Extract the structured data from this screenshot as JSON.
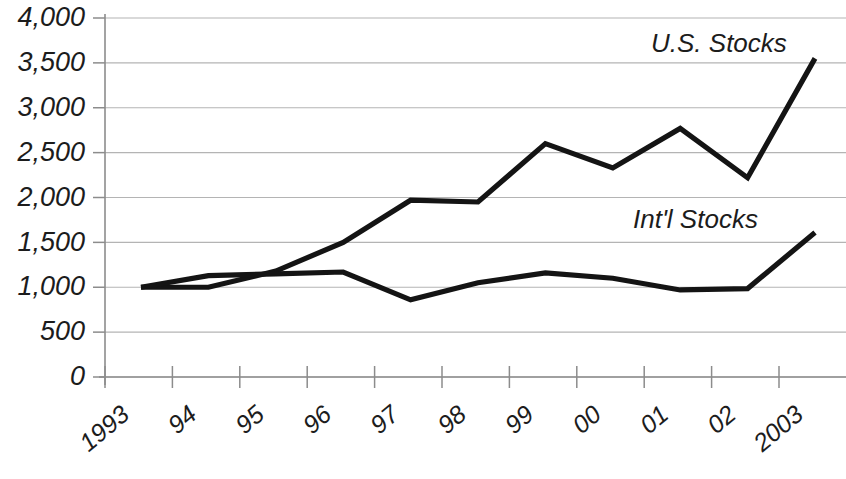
{
  "chart_data": {
    "type": "line",
    "title": "",
    "subtitle": "",
    "xlabel": "",
    "ylabel": "",
    "categories": [
      "1993",
      "94",
      "95",
      "96",
      "97",
      "98",
      "99",
      "00",
      "01",
      "02",
      "2003"
    ],
    "x_tick_labels": [
      "1993",
      "94",
      "95",
      "96",
      "97",
      "98",
      "99",
      "00",
      "01",
      "02",
      "2003"
    ],
    "y_tick_labels": [
      "4,000",
      "3,500",
      "3,000",
      "2,500",
      "2,000",
      "1,500",
      "1,000",
      "500",
      "0"
    ],
    "y_tick_values": [
      4000,
      3500,
      3000,
      2500,
      2000,
      1500,
      1000,
      500,
      0
    ],
    "ylim": [
      0,
      4000
    ],
    "grid": true,
    "grid_axis": "y",
    "legend_position": "inline-annotation",
    "series": [
      {
        "name": "U.S. Stocks",
        "color": "#141414",
        "values": [
          1000,
          1000,
          1180,
          1500,
          1970,
          1950,
          2600,
          2330,
          2770,
          2220,
          3550
        ]
      },
      {
        "name": "Int'l Stocks",
        "color": "#141414",
        "values": [
          1000,
          1130,
          1150,
          1170,
          860,
          1050,
          1160,
          1100,
          970,
          985,
          1610
        ]
      }
    ],
    "annotations": [
      {
        "text": "U.S. Stocks",
        "x": 651,
        "y": 52
      },
      {
        "text": "Int'l Stocks",
        "x": 633,
        "y": 228
      }
    ]
  },
  "axes": {
    "plot_left": 105,
    "plot_right": 846,
    "plot_top": 18,
    "plot_bottom": 377,
    "first_point_x": 141,
    "point_spacing": 67.4
  }
}
